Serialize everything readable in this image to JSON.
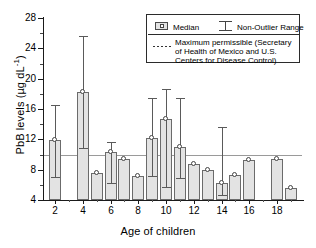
{
  "chart_data": {
    "type": "bar",
    "title": "",
    "subtitle": "",
    "xlabel": "Age of children",
    "ylabel": "PbB levels (µg dL⁻¹)",
    "ylabel_main": "PbB levels (µg dL",
    "ylabel_sup": "-1",
    "ylabel_tail": ")",
    "ylim": [
      4,
      28
    ],
    "yticks": [
      4,
      8,
      12,
      16,
      20,
      24,
      28
    ],
    "ytick_labels": [
      "4",
      "8",
      "12",
      "16",
      "20",
      "24",
      "28"
    ],
    "xlim": [
      1.2,
      19.8
    ],
    "xticks": [
      2,
      4,
      6,
      8,
      10,
      12,
      14,
      16,
      18
    ],
    "xtick_labels": [
      "2",
      "4",
      "6",
      "8",
      "10",
      "12",
      "14",
      "16",
      "18"
    ],
    "x_minor_ticks": [
      3,
      5,
      7,
      9,
      11,
      13,
      15,
      17,
      19
    ],
    "grid": false,
    "legend_position": "top-right",
    "reference_line": {
      "value": 10,
      "style": "solid-thin",
      "label": "Maximum permissible (Secretary of Health of Mexico and U.S. Centers for Disease Control)"
    },
    "categories": [
      2,
      3,
      4,
      5,
      6,
      7,
      8,
      9,
      10,
      11,
      12,
      13,
      14,
      15,
      16,
      18,
      19
    ],
    "series": [
      {
        "name": "Median",
        "values": [
          11.9,
          null,
          18.2,
          7.5,
          10.3,
          9.4,
          7.1,
          12.2,
          14.7,
          11.0,
          8.7,
          7.9,
          6.2,
          7.3,
          9.3,
          9.4,
          5.6
        ]
      },
      {
        "name": "Non-Outlier Range",
        "lower": [
          7.0,
          null,
          10.8,
          null,
          6.3,
          null,
          null,
          7.1,
          5.7,
          6.9,
          null,
          null,
          4.7,
          null,
          null,
          null,
          null
        ],
        "upper": [
          16.5,
          null,
          25.6,
          null,
          11.6,
          null,
          null,
          17.4,
          18.7,
          17.4,
          null,
          null,
          13.6,
          null,
          null,
          null,
          null
        ]
      }
    ],
    "bars": [
      {
        "age": 2,
        "median": 11.9,
        "low": 7.0,
        "high": 16.5
      },
      {
        "age": 4,
        "median": 18.2,
        "low": 10.8,
        "high": 25.6
      },
      {
        "age": 5,
        "median": 7.5,
        "low": null,
        "high": null
      },
      {
        "age": 6,
        "median": 10.3,
        "low": 6.3,
        "high": 11.6
      },
      {
        "age": 7,
        "median": 9.4,
        "low": null,
        "high": null
      },
      {
        "age": 8,
        "median": 7.1,
        "low": null,
        "high": null
      },
      {
        "age": 9,
        "median": 12.2,
        "low": 7.1,
        "high": 17.4
      },
      {
        "age": 10,
        "median": 14.7,
        "low": 5.7,
        "high": 18.7
      },
      {
        "age": 11,
        "median": 11.0,
        "low": 6.9,
        "high": 17.4
      },
      {
        "age": 12,
        "median": 8.7,
        "low": null,
        "high": null
      },
      {
        "age": 13,
        "median": 7.9,
        "low": null,
        "high": null
      },
      {
        "age": 14,
        "median": 6.2,
        "low": 4.7,
        "high": 13.6
      },
      {
        "age": 15,
        "median": 7.3,
        "low": null,
        "high": null
      },
      {
        "age": 16,
        "median": 9.3,
        "low": null,
        "high": null
      },
      {
        "age": 18,
        "median": 9.4,
        "low": null,
        "high": null
      },
      {
        "age": 19,
        "median": 5.6,
        "low": null,
        "high": null
      }
    ]
  },
  "legend": {
    "median_label": "Median",
    "range_label": "Non-Outlier Range",
    "note_line1": "Maximum permissible (Secretary",
    "note_line2": "of Health of Mexico and U.S.",
    "note_line3": "Centers for Disease Control)"
  }
}
